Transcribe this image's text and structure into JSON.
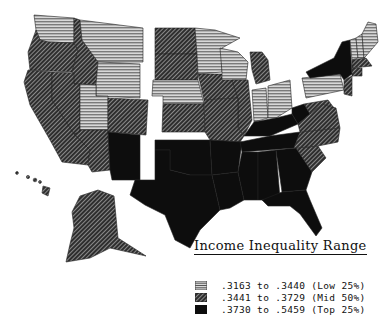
{
  "legend": {
    "title": "Income Inequality Range",
    "items": [
      {
        "label": ".3163 to .3440 (Low 25%)",
        "pattern": "horizontal-stripes",
        "fill": "#9a9a9a"
      },
      {
        "label": ".3441 to .3729 (Mid 50%)",
        "pattern": "crosshatch",
        "fill": "#3a3a3a"
      },
      {
        "label": ".3730 to .5459 (Top 25%)",
        "pattern": "solid",
        "fill": "#0d0d0d"
      }
    ]
  },
  "categories": {
    "low": [
      "WA",
      "MT",
      "WY",
      "UT",
      "MN",
      "WI",
      "NE",
      "IN",
      "OH",
      "PA",
      "VT",
      "NH",
      "ME",
      "NJ"
    ],
    "mid": [
      "OR",
      "ID",
      "CA",
      "NV",
      "AZ",
      "CO",
      "ND",
      "SD",
      "KS",
      "IA",
      "IL",
      "MO",
      "MI",
      "VA",
      "NC",
      "SC",
      "MD",
      "DE",
      "MA",
      "CT",
      "RI",
      "HI",
      "AK"
    ],
    "top": [
      "NM",
      "OK",
      "TX",
      "AR",
      "LA",
      "MS",
      "AL",
      "TN",
      "KY",
      "GA",
      "FL",
      "WV",
      "NY"
    ]
  }
}
